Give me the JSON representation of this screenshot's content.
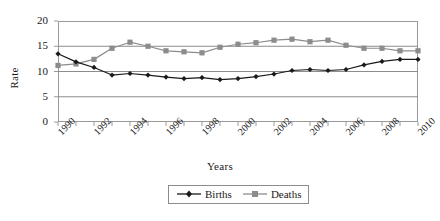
{
  "chart_data": {
    "type": "line",
    "title": "",
    "xlabel": "Years",
    "ylabel": "Rate",
    "x": [
      1990,
      1991,
      1992,
      1993,
      1994,
      1995,
      1996,
      1997,
      1998,
      1999,
      2000,
      2001,
      2002,
      2003,
      2004,
      2005,
      2006,
      2007,
      2008,
      2009,
      2010
    ],
    "categories": [
      "1990",
      "1991",
      "1992",
      "1993",
      "1994",
      "1995",
      "1996",
      "1997",
      "1998",
      "1999",
      "2000",
      "2001",
      "2002",
      "2003",
      "2004",
      "2005",
      "2006",
      "2007",
      "2008",
      "2009",
      "2010"
    ],
    "tick_labels_shown": [
      "1990",
      "1992",
      "1994",
      "1996",
      "1998",
      "2000",
      "2002",
      "2004",
      "2006",
      "2008",
      "2010"
    ],
    "ylim": [
      0,
      20
    ],
    "yticks": [
      0,
      5,
      10,
      15,
      20
    ],
    "xlim": [
      1990,
      2010
    ],
    "grid": "horizontal",
    "legend_position": "bottom-center",
    "series": [
      {
        "name": "Births",
        "color": "#1a1a1a",
        "marker": "diamond",
        "values": [
          13.5,
          11.9,
          10.8,
          9.3,
          9.6,
          9.3,
          8.9,
          8.6,
          8.8,
          8.4,
          8.6,
          9.0,
          9.5,
          10.2,
          10.4,
          10.2,
          10.4,
          11.3,
          12.0,
          12.4,
          12.4
        ]
      },
      {
        "name": "Deaths",
        "color": "#8c8c8c",
        "marker": "square",
        "values": [
          11.2,
          11.5,
          12.4,
          14.6,
          15.8,
          15.0,
          14.1,
          13.9,
          13.7,
          14.8,
          15.4,
          15.7,
          16.2,
          16.4,
          15.9,
          16.2,
          15.2,
          14.6,
          14.6,
          14.1,
          14.1
        ]
      }
    ]
  },
  "legend": {
    "entries": [
      {
        "label": "Births"
      },
      {
        "label": "Deaths"
      }
    ]
  },
  "axes": {
    "y_title": "Rate",
    "x_title": "Years"
  },
  "colors": {
    "births": "#1a1a1a",
    "deaths": "#8c8c8c",
    "gridline": "#8c8c8c",
    "frame": "#9a9a9a",
    "background": "#ffffff"
  }
}
